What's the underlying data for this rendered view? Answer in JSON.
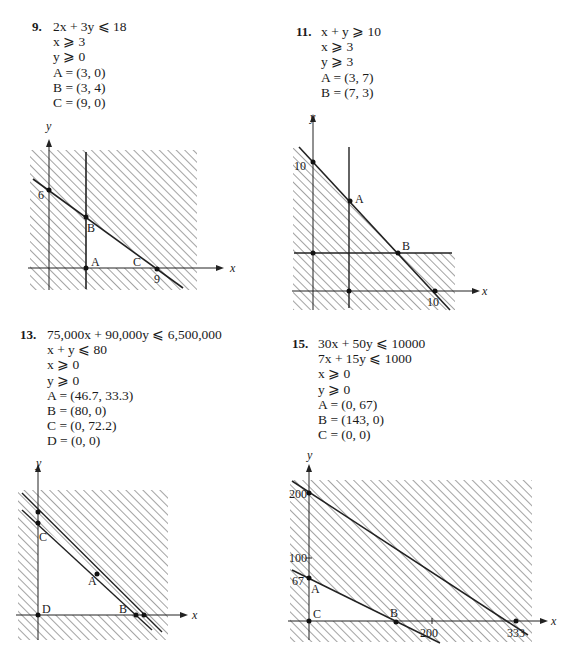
{
  "problems": [
    {
      "number": "9.",
      "lines": [
        "2x + 3y ⩽ 18",
        "x ⩾ 3",
        "y ⩾ 0",
        "A = (3, 0)",
        "B = (3, 4)",
        "C = (9, 0)"
      ],
      "graph": {
        "axis_x": "x",
        "axis_y": "y",
        "tick_labels": {
          "y_intercept": "6",
          "x_intercept": "9"
        },
        "points": {
          "A": "A",
          "B": "B",
          "C": "C"
        }
      }
    },
    {
      "number": "11.",
      "lines": [
        "x + y ⩾ 10",
        "x ⩾ 3",
        "y ⩾ 3",
        "A = (3, 7)",
        "B = (7, 3)"
      ],
      "graph": {
        "axis_x": "x",
        "axis_y": "y",
        "tick_labels": {
          "y_intercept": "10",
          "x_intercept": "10"
        },
        "points": {
          "A": "A",
          "B": "B"
        }
      }
    },
    {
      "number": "13.",
      "lines": [
        "75,000x + 90,000y ⩽ 6,500,000",
        "x + y ⩽ 80",
        "x ⩾ 0",
        "y ⩾ 0",
        "A = (46.7, 33.3)",
        "B = (80, 0)",
        "C = (0, 72.2)",
        "D = (0, 0)"
      ],
      "graph": {
        "axis_x": "x",
        "axis_y": "y",
        "points": {
          "A": "A",
          "B": "B",
          "C": "C",
          "D": "D"
        }
      }
    },
    {
      "number": "15.",
      "lines": [
        "30x + 50y ⩽ 10000",
        "7x + 15y ⩽ 1000",
        "x ⩾ 0",
        "y ⩾ 0",
        "A = (0, 67)",
        "B = (143, 0)",
        "C = (0, 0)"
      ],
      "graph": {
        "axis_x": "x",
        "axis_y": "y",
        "tick_labels": {
          "y200": "200",
          "y100": "100",
          "y67": "67",
          "x200": "200",
          "x333": "333"
        },
        "points": {
          "A": "A",
          "B": "B",
          "C": "C"
        }
      }
    }
  ]
}
